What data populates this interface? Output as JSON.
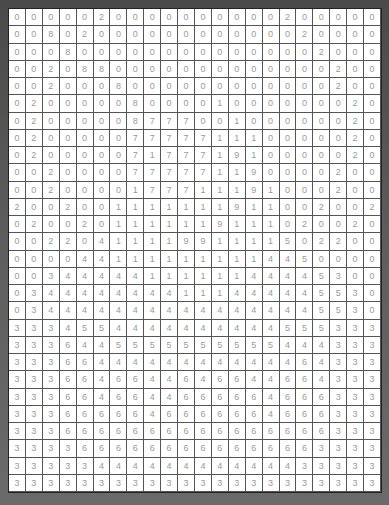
{
  "grid": {
    "rows": 26,
    "cols": 22,
    "values": [
      [
        0,
        0,
        0,
        0,
        0,
        2,
        0,
        0,
        0,
        0,
        0,
        0,
        0,
        0,
        0,
        0,
        2,
        0,
        0,
        0,
        0,
        0
      ],
      [
        0,
        0,
        8,
        0,
        2,
        0,
        0,
        0,
        0,
        0,
        0,
        0,
        0,
        0,
        0,
        0,
        0,
        2,
        0,
        0,
        0,
        0
      ],
      [
        0,
        0,
        0,
        8,
        0,
        0,
        0,
        0,
        0,
        0,
        0,
        0,
        0,
        0,
        0,
        0,
        0,
        0,
        2,
        0,
        0,
        0
      ],
      [
        0,
        0,
        2,
        0,
        8,
        8,
        0,
        0,
        0,
        0,
        0,
        0,
        0,
        0,
        0,
        0,
        0,
        0,
        0,
        2,
        0,
        0
      ],
      [
        0,
        0,
        2,
        0,
        0,
        0,
        8,
        0,
        0,
        0,
        0,
        0,
        0,
        0,
        0,
        0,
        0,
        0,
        0,
        2,
        0,
        0
      ],
      [
        0,
        2,
        0,
        0,
        0,
        0,
        0,
        8,
        0,
        0,
        0,
        0,
        1,
        0,
        0,
        0,
        0,
        0,
        0,
        0,
        2,
        0
      ],
      [
        0,
        2,
        0,
        0,
        0,
        0,
        0,
        8,
        7,
        7,
        7,
        0,
        0,
        1,
        0,
        0,
        0,
        0,
        0,
        0,
        2,
        0
      ],
      [
        0,
        2,
        0,
        0,
        0,
        0,
        0,
        7,
        7,
        7,
        7,
        7,
        1,
        1,
        1,
        0,
        0,
        0,
        0,
        0,
        2,
        0
      ],
      [
        0,
        2,
        0,
        0,
        0,
        0,
        0,
        7,
        1,
        7,
        7,
        7,
        1,
        9,
        1,
        0,
        0,
        0,
        0,
        0,
        2,
        0
      ],
      [
        0,
        0,
        2,
        0,
        0,
        0,
        0,
        7,
        7,
        7,
        7,
        7,
        1,
        1,
        9,
        0,
        0,
        0,
        0,
        2,
        0,
        0
      ],
      [
        0,
        0,
        2,
        0,
        0,
        0,
        0,
        1,
        7,
        7,
        7,
        1,
        1,
        1,
        9,
        1,
        0,
        0,
        0,
        2,
        0,
        0
      ],
      [
        2,
        0,
        0,
        2,
        0,
        0,
        1,
        1,
        1,
        1,
        1,
        1,
        1,
        9,
        1,
        1,
        0,
        0,
        2,
        0,
        0,
        2
      ],
      [
        0,
        2,
        0,
        0,
        2,
        0,
        1,
        1,
        1,
        1,
        1,
        1,
        9,
        1,
        1,
        1,
        0,
        2,
        0,
        0,
        2,
        0
      ],
      [
        0,
        0,
        2,
        2,
        0,
        4,
        1,
        1,
        1,
        1,
        9,
        9,
        1,
        1,
        1,
        1,
        5,
        0,
        2,
        2,
        0,
        0
      ],
      [
        0,
        0,
        0,
        0,
        4,
        4,
        1,
        1,
        1,
        1,
        1,
        1,
        1,
        1,
        1,
        4,
        4,
        5,
        0,
        0,
        0,
        0
      ],
      [
        0,
        0,
        3,
        4,
        4,
        4,
        4,
        4,
        1,
        1,
        1,
        1,
        1,
        1,
        4,
        4,
        4,
        4,
        5,
        3,
        0,
        0
      ],
      [
        0,
        3,
        4,
        4,
        4,
        4,
        4,
        4,
        4,
        4,
        1,
        1,
        1,
        4,
        4,
        4,
        4,
        4,
        5,
        5,
        3,
        0
      ],
      [
        0,
        3,
        4,
        4,
        4,
        4,
        4,
        4,
        4,
        4,
        4,
        4,
        4,
        4,
        4,
        4,
        4,
        4,
        5,
        5,
        3,
        0
      ],
      [
        3,
        3,
        3,
        4,
        5,
        5,
        4,
        4,
        4,
        4,
        4,
        4,
        4,
        4,
        4,
        4,
        5,
        5,
        5,
        3,
        3,
        3
      ],
      [
        3,
        3,
        3,
        6,
        4,
        4,
        5,
        5,
        5,
        5,
        5,
        5,
        5,
        5,
        5,
        5,
        4,
        4,
        4,
        3,
        3,
        3
      ],
      [
        3,
        3,
        3,
        6,
        6,
        4,
        4,
        4,
        4,
        4,
        4,
        4,
        4,
        4,
        4,
        4,
        4,
        6,
        4,
        3,
        3,
        3
      ],
      [
        3,
        3,
        3,
        6,
        6,
        4,
        6,
        6,
        4,
        4,
        6,
        4,
        6,
        6,
        4,
        4,
        6,
        6,
        4,
        3,
        3,
        3
      ],
      [
        3,
        3,
        3,
        6,
        6,
        4,
        6,
        6,
        4,
        4,
        6,
        6,
        6,
        6,
        6,
        4,
        6,
        6,
        6,
        3,
        3,
        3
      ],
      [
        3,
        3,
        3,
        6,
        6,
        6,
        6,
        6,
        4,
        6,
        6,
        6,
        6,
        6,
        6,
        4,
        6,
        6,
        6,
        3,
        3,
        3
      ],
      [
        3,
        3,
        3,
        6,
        6,
        6,
        6,
        6,
        6,
        6,
        6,
        6,
        6,
        6,
        6,
        6,
        6,
        6,
        6,
        3,
        3,
        3
      ],
      [
        3,
        3,
        3,
        3,
        6,
        6,
        6,
        6,
        6,
        6,
        6,
        6,
        6,
        6,
        6,
        6,
        6,
        6,
        3,
        3,
        3,
        3
      ],
      [
        3,
        3,
        3,
        3,
        3,
        4,
        4,
        4,
        4,
        4,
        4,
        4,
        4,
        4,
        4,
        4,
        4,
        3,
        3,
        3,
        3,
        3
      ],
      [
        3,
        3,
        3,
        3,
        3,
        3,
        3,
        3,
        3,
        3,
        3,
        3,
        3,
        3,
        3,
        3,
        3,
        3,
        3,
        3,
        3,
        3
      ]
    ]
  }
}
